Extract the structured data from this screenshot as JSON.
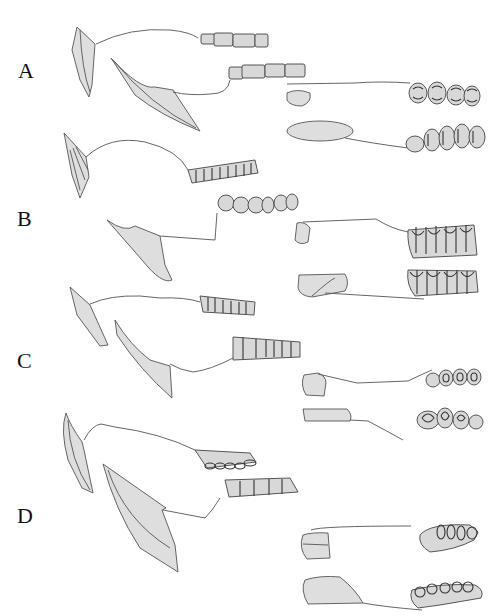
{
  "figure": {
    "panels": [
      {
        "label": "A",
        "description": "skull and mandible profile with cheek teeth and occlusal views"
      },
      {
        "label": "B",
        "description": "skull and mandible profile with hypsodont cheek teeth and occlusal views"
      },
      {
        "label": "C",
        "description": "skull and mandible profile with cheek teeth and occlusal views"
      },
      {
        "label": "D",
        "description": "skull and mandible profile with cheek teeth and occlusal views"
      }
    ],
    "colors": {
      "fill": "#dedede",
      "stroke": "#555555",
      "background": "#ffffff",
      "text": "#111111"
    }
  }
}
